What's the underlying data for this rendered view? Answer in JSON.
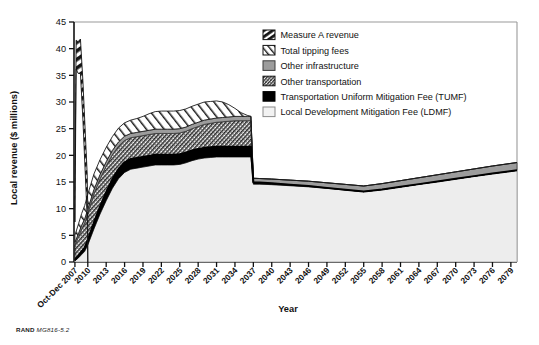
{
  "figure": {
    "source_note_prefix": "RAND",
    "source_note_id": "MG816-5.2"
  },
  "chart_data": {
    "type": "area",
    "stacked": true,
    "title": "",
    "xlabel": "Year",
    "ylabel": "Local revenue ($ millions)",
    "ylim": [
      0,
      45
    ],
    "ytick_values": [
      0,
      5,
      10,
      15,
      20,
      25,
      30,
      35,
      40,
      45
    ],
    "ytick_labels": [
      "0",
      "5",
      "10",
      "15",
      "20",
      "25",
      "30",
      "35",
      "40",
      "45"
    ],
    "xlim": [
      2007.75,
      2080
    ],
    "xtick_labels": [
      "Oct-Dec 2007",
      "2010",
      "2013",
      "2016",
      "2019",
      "2022",
      "2025",
      "2028",
      "2031",
      "2034",
      "2037",
      "2040",
      "2043",
      "2046",
      "2049",
      "2052",
      "2055",
      "2058",
      "2061",
      "2064",
      "2067",
      "2070",
      "2073",
      "2076",
      "2079"
    ],
    "xtick_values": [
      2007.9,
      2010,
      2013,
      2016,
      2019,
      2022,
      2025,
      2028,
      2031,
      2034,
      2037,
      2040,
      2043,
      2046,
      2049,
      2052,
      2055,
      2058,
      2061,
      2064,
      2067,
      2070,
      2073,
      2076,
      2079
    ],
    "grid": false,
    "legend_position": "top-right",
    "legend": [
      {
        "label": "Measure A revenue",
        "pattern": "diagonal-wide-dark",
        "fill": "#f5f5f5",
        "stroke": "#111111"
      },
      {
        "label": "Total tipping fees",
        "pattern": "diagonal-wide-light",
        "fill": "#ffffff",
        "stroke": "#111111"
      },
      {
        "label": "Other infrastructure",
        "pattern": "solid-gray",
        "fill": "#9a9a9a",
        "stroke": "#3a3a3a"
      },
      {
        "label": "Other transportation",
        "pattern": "crosshatch-fine",
        "fill": "#ffffff",
        "stroke": "#111111"
      },
      {
        "label": "Transportation Uniform Mitigation Fee (TUMF)",
        "pattern": "solid-black",
        "fill": "#000000",
        "stroke": "#000000"
      },
      {
        "label": "Local Development Mitigation Fee (LDMF)",
        "pattern": "solid-light",
        "fill": "#eeeeee",
        "stroke": "#8a8a8a"
      }
    ],
    "x": [
      2007.9,
      2008.5,
      2009,
      2009.5,
      2010,
      2011,
      2012,
      2013,
      2014,
      2015,
      2016,
      2017,
      2018,
      2019,
      2020,
      2021,
      2022,
      2023,
      2024,
      2025,
      2026,
      2027,
      2028,
      2029,
      2030,
      2031,
      2032,
      2033,
      2034,
      2035,
      2036,
      2036.6,
      2037,
      2038,
      2040,
      2043,
      2046,
      2049,
      2052,
      2055,
      2058,
      2061,
      2064,
      2067,
      2070,
      2073,
      2076,
      2080
    ],
    "series": [
      {
        "name": "Local Development Mitigation Fee (LDMF)",
        "values": [
          0.2,
          0.8,
          1.4,
          2.0,
          3.2,
          6.2,
          9.0,
          11.5,
          13.8,
          15.6,
          16.8,
          17.4,
          17.6,
          17.8,
          18.0,
          18.2,
          18.2,
          18.2,
          18.2,
          18.3,
          18.6,
          19.0,
          19.3,
          19.5,
          19.6,
          19.7,
          19.7,
          19.7,
          19.7,
          19.7,
          19.7,
          19.7,
          14.6,
          14.6,
          14.5,
          14.3,
          14.1,
          13.8,
          13.5,
          13.2,
          13.6,
          14.1,
          14.6,
          15.1,
          15.6,
          16.1,
          16.6,
          17.2
        ]
      },
      {
        "name": "Transportation Uniform Mitigation Fee (TUMF)",
        "values": [
          0.2,
          0.4,
          0.6,
          0.7,
          0.9,
          1.2,
          1.4,
          1.6,
          1.7,
          1.8,
          1.9,
          1.9,
          1.9,
          1.9,
          1.9,
          1.9,
          1.9,
          1.9,
          1.9,
          1.9,
          1.9,
          1.9,
          1.9,
          1.9,
          1.9,
          1.9,
          1.9,
          1.9,
          1.9,
          1.9,
          1.9,
          1.9,
          0.35,
          0.3,
          0.25,
          0.2,
          0.15,
          0.1,
          0.05,
          0.0,
          0.0,
          0.0,
          0.0,
          0.0,
          0.0,
          0.0,
          0.0,
          0.0
        ]
      },
      {
        "name": "Other transportation",
        "values": [
          2.8,
          3.6,
          4.2,
          4.6,
          5.0,
          5.4,
          5.2,
          4.9,
          4.6,
          4.3,
          4.1,
          4.0,
          4.0,
          4.0,
          4.0,
          4.0,
          4.0,
          4.0,
          4.0,
          4.0,
          4.0,
          4.1,
          4.2,
          4.4,
          4.5,
          4.6,
          4.7,
          4.8,
          4.9,
          4.9,
          4.9,
          4.9,
          0.0,
          0.0,
          0.0,
          0.0,
          0.0,
          0.0,
          0.0,
          0.0,
          0.0,
          0.0,
          0.0,
          0.0,
          0.0,
          0.0,
          0.0,
          0.0
        ]
      },
      {
        "name": "Other infrastructure",
        "values": [
          0.5,
          0.6,
          0.7,
          0.8,
          0.8,
          0.8,
          0.8,
          0.8,
          0.8,
          0.8,
          0.8,
          0.8,
          0.8,
          0.8,
          0.8,
          0.8,
          0.8,
          0.8,
          0.8,
          0.8,
          0.8,
          0.8,
          0.8,
          0.8,
          0.8,
          0.8,
          0.8,
          0.8,
          0.8,
          0.8,
          0.8,
          0.8,
          0.75,
          0.75,
          0.8,
          0.85,
          0.9,
          0.95,
          1.0,
          1.05,
          1.1,
          1.15,
          1.2,
          1.25,
          1.3,
          1.35,
          1.4,
          1.45
        ]
      },
      {
        "name": "Total tipping fees",
        "values": [
          1.3,
          1.8,
          2.2,
          2.5,
          2.8,
          2.9,
          2.8,
          2.7,
          2.6,
          2.6,
          2.5,
          2.5,
          2.6,
          2.8,
          3.1,
          3.3,
          3.4,
          3.4,
          3.4,
          3.4,
          3.4,
          3.4,
          3.4,
          3.4,
          3.3,
          3.2,
          2.9,
          2.3,
          1.5,
          0.7,
          0.2,
          0.0,
          0.0,
          0.0,
          0.0,
          0.0,
          0.0,
          0.0,
          0.0,
          0.0,
          0.0,
          0.0,
          0.0,
          0.0,
          0.0,
          0.0,
          0.0,
          0.0
        ]
      },
      {
        "name": "Measure A revenue",
        "comment": "narrow spike only in the earliest years",
        "x": [
          2007.9,
          2008.1,
          2008.4,
          2008.8,
          2009.2,
          2009.6,
          2009.9,
          2010.0
        ],
        "top_values": [
          12.5,
          41.6,
          41.3,
          41.8,
          34.0,
          24.0,
          16.5,
          9.5
        ],
        "values": [
          7.5,
          36.2,
          35.4,
          35.3,
          26.8,
          16.3,
          8.4,
          0.0
        ]
      }
    ]
  }
}
